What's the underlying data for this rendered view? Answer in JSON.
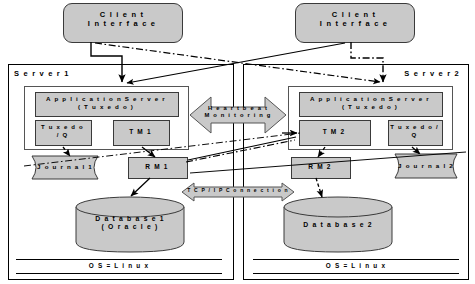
{
  "diagram": {
    "colors": {
      "shape_fill": "#c9c9c9",
      "shape_stroke": "#3a3a3a",
      "frame_stroke": "#000000",
      "background": "#ffffff"
    }
  },
  "clients": [
    {
      "label": "C l i e n t\nI n t e r f a c e"
    },
    {
      "label": "C l i e n t\nI n t e r f a c e"
    }
  ],
  "servers": [
    {
      "name": "S e r v e r  1",
      "app_server": "A p p l i c a t i o n   S e r v e r\n( T u x e d o )",
      "queue": "T u x e d o\n/ Q",
      "transaction_manager": "T M  1",
      "journal": "J o u r n a l  1",
      "resource_manager": "R M  1",
      "database": "D a t a b a s e  1\n( O r a c l e )",
      "os": "O S  =  L i n u x"
    },
    {
      "name": "S e r v e r  2",
      "app_server": "A p p l i c a t i o n   S e r v e r\n( T u x e d o )",
      "queue": "T u x e d o /\nQ",
      "transaction_manager": "T M  2",
      "journal": "J o u r n a l  2",
      "resource_manager": "R M  2",
      "database": "D a t a b a s e  2",
      "os": "O S  =  L i n u x"
    }
  ],
  "center": {
    "heartbeat": "H e a r t b e a t\nM o n i t o r i n g",
    "tcpip": "T C P / I P  C o n n e c t i o n"
  }
}
